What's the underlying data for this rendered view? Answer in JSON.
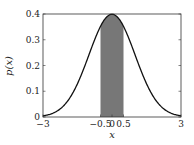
{
  "chart_data": {
    "type": "area",
    "title": "",
    "xlabel": "x",
    "ylabel": "p(x)",
    "xlim": [
      -3,
      3
    ],
    "ylim": [
      0,
      0.4
    ],
    "grid": false,
    "legend": null,
    "x_ticks": [
      -3,
      -0.5,
      0,
      0.5,
      3
    ],
    "x_tick_labels": [
      "−3",
      "−0.5",
      "0",
      "0.5",
      "3"
    ],
    "y_ticks": [
      0,
      0.1,
      0.2,
      0.3,
      0.4
    ],
    "y_tick_labels": [
      "0",
      "0.1",
      "0.2",
      "0.3",
      "0.4"
    ],
    "series": [
      {
        "name": "standard normal pdf",
        "function": "p(x) = exp(-x^2/2)/sqrt(2*pi)",
        "x": [
          -3,
          -2.5,
          -2,
          -1.5,
          -1,
          -0.5,
          0,
          0.5,
          1,
          1.5,
          2,
          2.5,
          3
        ],
        "values": [
          0.0044,
          0.0175,
          0.054,
          0.1295,
          0.242,
          0.3521,
          0.3989,
          0.3521,
          0.242,
          0.1295,
          0.054,
          0.0175,
          0.0044
        ],
        "color": "#111111"
      }
    ],
    "shaded_region": {
      "x_from": -0.5,
      "x_to": 0.5,
      "color": "#777777"
    }
  }
}
